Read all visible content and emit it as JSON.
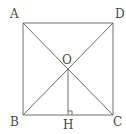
{
  "diagram": {
    "type": "geometry-square",
    "stroke_color": "#6e6e6e",
    "label_color": "#4a4a4a",
    "points": {
      "A": {
        "label": "A",
        "x": 23,
        "y": 23
      },
      "D": {
        "label": "D",
        "x": 113,
        "y": 23
      },
      "B": {
        "label": "B",
        "x": 23,
        "y": 115
      },
      "C": {
        "label": "C",
        "x": 113,
        "y": 115
      },
      "O": {
        "label": "O",
        "x": 68,
        "y": 69
      },
      "H": {
        "label": "H",
        "x": 68,
        "y": 115
      }
    },
    "segments": [
      "AD",
      "DC",
      "CB",
      "BA",
      "AC",
      "BD",
      "OH"
    ],
    "right_angle_marker": "OHC"
  }
}
